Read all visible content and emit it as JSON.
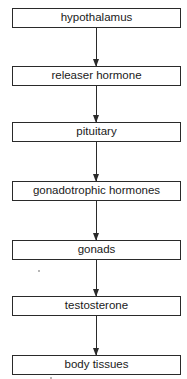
{
  "diagram": {
    "type": "vertical-flowchart",
    "nodes": [
      {
        "id": "n1",
        "label": "hypothalamus"
      },
      {
        "id": "n2",
        "label": "releaser hormone"
      },
      {
        "id": "n3",
        "label": "pituitary"
      },
      {
        "id": "n4",
        "label": "gonadotrophic hormones"
      },
      {
        "id": "n5",
        "label": "gonads"
      },
      {
        "id": "n6",
        "label": "testosterone"
      },
      {
        "id": "n7",
        "label": "body tissues"
      }
    ],
    "edges": [
      {
        "from": "n1",
        "to": "n2"
      },
      {
        "from": "n2",
        "to": "n3"
      },
      {
        "from": "n3",
        "to": "n4"
      },
      {
        "from": "n4",
        "to": "n5"
      },
      {
        "from": "n5",
        "to": "n6"
      },
      {
        "from": "n6",
        "to": "n7"
      }
    ],
    "colors": {
      "stroke": "#2a2a2a",
      "fill": "#ffffff",
      "text": "#1a1a1a"
    }
  }
}
